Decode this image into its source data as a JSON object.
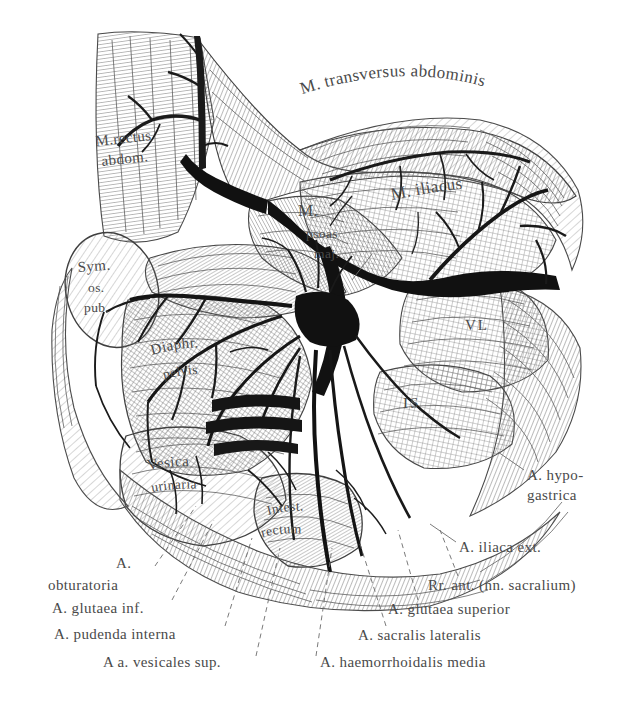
{
  "figure": {
    "style": "steel-engraving line art, black ink on white paper",
    "background_color": "#ffffff",
    "ink_color": "#2b2b2b",
    "label_color": "#4a4a4a",
    "width": 644,
    "height": 713
  },
  "labels": {
    "transversus": "M. transversus abdominis",
    "rectus_line1": "M.rectus",
    "rectus_line2": "abdom.",
    "sym_line1": "Sym.",
    "sym_line2": "os.",
    "sym_line3": "pub.",
    "psoas_m": "M.",
    "psoas_line2": "psoas",
    "psoas_line3": "maj.",
    "iliacus": "M. iliacus",
    "vl": "VL",
    "is": "IS",
    "diaphr_line1": "Diaphr.",
    "diaphr_line2": "pelvis",
    "vesica_line1": "Vesica",
    "vesica_line2": "urinaria",
    "intest_line1": "Intest.",
    "intest_line2": "rectum",
    "hypogastrica_line1": "A. hypo-",
    "hypogastrica_line2": "gastrica",
    "iliaca_ext": "A. iliaca ext.",
    "obturatoria_line1": "A.",
    "obturatoria_line2": "obturatoria",
    "glutaea_inf": "A. glutaea inf.",
    "pudenda_interna": "A. pudenda interna",
    "vesicales_sup": "A a. vesicales sup.",
    "rr_ant": "Rr. ant. (nn. sacralium)",
    "glutaea_superior": "A. glutaea superior",
    "sacralis_lateralis": "A. sacralis lateralis",
    "haemorrhoidalis_media": "A. haemorrhoidalis media"
  }
}
